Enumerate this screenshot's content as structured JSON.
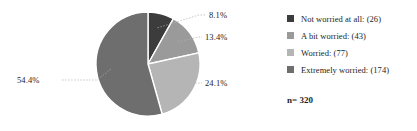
{
  "chart_data": {
    "type": "pie",
    "title": "",
    "subtitle": "",
    "xlabel": "",
    "ylabel": "",
    "legend_position": "right",
    "grid": false,
    "categories": [
      "Not worried at all: (26)",
      "A bit worried: (43)",
      "Worried: (77)",
      "Extremely worried: (174)"
    ],
    "values": [
      26,
      43,
      77,
      174
    ],
    "percent_labels": [
      "8.1%",
      "13.4%",
      "24.1%",
      "54.4%"
    ],
    "percentages": [
      8.1,
      13.4,
      24.1,
      54.4
    ],
    "colors": [
      "#3c3c3c",
      "#9a9a9a",
      "#b5b5b5",
      "#6e6e6e"
    ],
    "total": 320,
    "sample_size_label": "n= 320",
    "start_angle_deg": 0,
    "direction": "clockwise",
    "slice_border_color": "#ffffff",
    "leader_line_color": "#b0b0b0"
  },
  "legend": {
    "items": [
      {
        "label": "Not worried at all: (26)",
        "color": "#3c3c3c"
      },
      {
        "label": "A bit worried: (43)",
        "color": "#9a9a9a"
      },
      {
        "label": "Worried: (77)",
        "color": "#b5b5b5"
      },
      {
        "label": "Extremely worried: (174)",
        "color": "#6e6e6e"
      }
    ]
  },
  "footer": {
    "sample_size": "n= 320"
  }
}
